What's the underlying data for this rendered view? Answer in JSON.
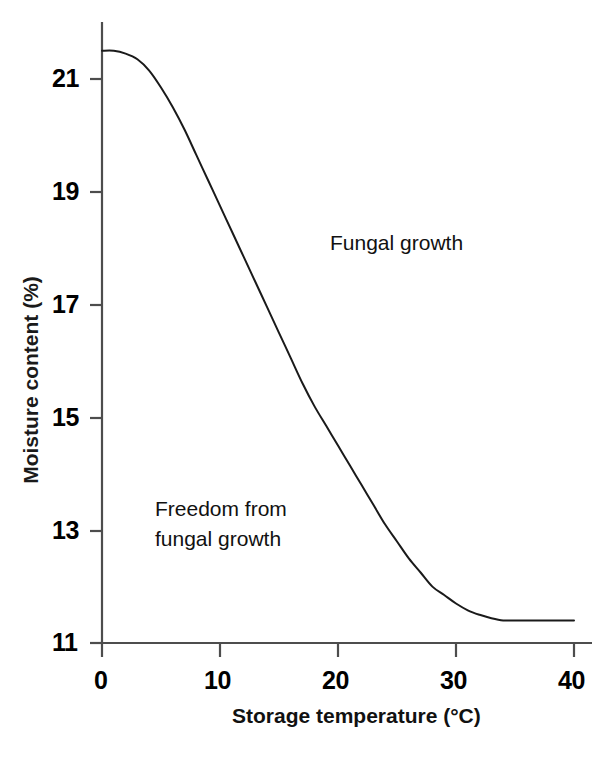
{
  "chart_data": {
    "type": "line",
    "title": "",
    "xlabel": "Storage temperature (°C)",
    "ylabel": "Moisture content (%)",
    "xlim": [
      0,
      40
    ],
    "ylim": [
      11,
      21.9
    ],
    "xticks": [
      0,
      10,
      20,
      30,
      40
    ],
    "xtick_labels": [
      "0",
      "10",
      "20",
      "30",
      "40"
    ],
    "yticks": [
      11,
      13,
      15,
      17,
      19,
      21
    ],
    "ytick_labels": [
      "11",
      "13",
      "15",
      "17",
      "19",
      "21"
    ],
    "grid": false,
    "legend": "none",
    "series": [
      {
        "name": "Safe moisture content limit",
        "x": [
          0,
          1,
          2,
          3,
          4,
          5,
          6,
          7,
          8,
          9,
          10,
          11,
          12,
          13,
          14,
          15,
          16,
          17,
          18,
          19,
          20,
          21,
          22,
          23,
          24,
          25,
          26,
          27,
          28,
          29,
          30,
          31,
          32,
          33,
          34,
          35,
          36,
          37,
          38,
          39,
          40
        ],
        "y": [
          21.5,
          21.5,
          21.45,
          21.35,
          21.15,
          20.85,
          20.5,
          20.1,
          19.65,
          19.2,
          18.75,
          18.3,
          17.85,
          17.4,
          16.95,
          16.5,
          16.05,
          15.6,
          15.2,
          14.85,
          14.5,
          14.15,
          13.8,
          13.45,
          13.1,
          12.8,
          12.5,
          12.25,
          12.0,
          11.85,
          11.7,
          11.58,
          11.5,
          11.44,
          11.4,
          11.4,
          11.4,
          11.4,
          11.4,
          11.4,
          11.4
        ]
      }
    ],
    "annotations": [
      {
        "name": "fungal-growth-region",
        "text": "Fungal growth",
        "x": 21,
        "y": 18.0
      },
      {
        "name": "freedom-from-fungal-growth-region",
        "text_line1": "Freedom from",
        "text_line2": "fungal growth",
        "x": 7,
        "y": 13.3
      }
    ],
    "colors": {
      "curve": "#1a1a1a",
      "axis": "#4d4d4d",
      "text": "#111111",
      "background": "#ffffff"
    }
  },
  "axes": {
    "x_title": "Storage temperature (°C)",
    "y_title": "Moisture content (%)",
    "x_tick_labels": [
      "0",
      "10",
      "20",
      "30",
      "40"
    ],
    "y_tick_labels": [
      "21",
      "19",
      "17",
      "15",
      "13",
      "11"
    ]
  },
  "labels": {
    "fungal_growth": "Fungal growth",
    "freedom_line1": "Freedom from",
    "freedom_line2": "fungal growth"
  }
}
